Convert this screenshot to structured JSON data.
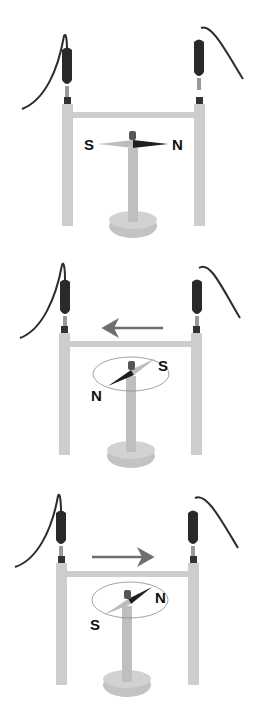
{
  "diagram": {
    "colors": {
      "stand": "#cdcdcd",
      "stand_shade": "#b8b8b8",
      "clip": "#2a2a2a",
      "wire": "#2b2b2b",
      "arrow": "#6e6e6e",
      "needle_dark": "#1e1e1e",
      "needle_light": "#bdbdbd",
      "orbit": "#8a8a8a"
    },
    "panels": [
      {
        "id": "no-current",
        "current_arrow": "none",
        "needle": {
          "north_label": "N",
          "south_label": "S",
          "orientation": "north-right"
        }
      },
      {
        "id": "current-left",
        "current_arrow": "left",
        "needle": {
          "north_label": "N",
          "south_label": "S",
          "orientation": "north-lower-left"
        }
      },
      {
        "id": "current-right",
        "current_arrow": "right",
        "needle": {
          "north_label": "N",
          "south_label": "S",
          "orientation": "north-upper-right"
        }
      }
    ]
  }
}
